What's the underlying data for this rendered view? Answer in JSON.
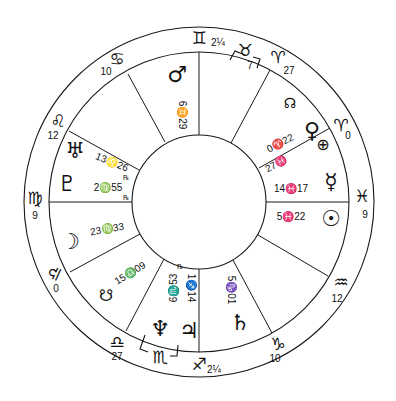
{
  "chart_title": "",
  "colors": {
    "ink": "#111111",
    "background": "#ffffff"
  },
  "wheel": {
    "center": [
      199,
      202
    ],
    "outer_radius": 175,
    "sign_ring_inner_radius": 150,
    "inner_circle_radius": 67
  },
  "signs_on_cusps": [
    {
      "id": "gemini",
      "glyph": "♊",
      "degree": "2¼",
      "label": "♊ 2¼"
    },
    {
      "id": "taurus",
      "glyph": "♉",
      "degree": "7",
      "label": "♉ 7 (intercepted)"
    },
    {
      "id": "aries-top",
      "glyph": "♈",
      "degree": "27",
      "label": "♈ 27"
    },
    {
      "id": "aries-right",
      "glyph": "♈",
      "degree": "0",
      "label": "♈ 0"
    },
    {
      "id": "pisces",
      "glyph": "♓",
      "degree": "9",
      "label": "♓ 9"
    },
    {
      "id": "aquarius",
      "glyph": "♒",
      "degree": "12",
      "label": "♒ 12"
    },
    {
      "id": "capricorn",
      "glyph": "♑",
      "degree": "10",
      "label": "♑ 10"
    },
    {
      "id": "sagittarius",
      "glyph": "♐",
      "degree": "2¼",
      "label": "♐ 2¼"
    },
    {
      "id": "scorpio",
      "glyph": "♏",
      "degree": "",
      "label": "♏ (intercepted)"
    },
    {
      "id": "libra-bottom",
      "glyph": "♎",
      "degree": "27",
      "label": "♎ 27"
    },
    {
      "id": "libra-left",
      "glyph": "♎",
      "degree": "0",
      "label": "♎ 0"
    },
    {
      "id": "virgo",
      "glyph": "♍",
      "degree": "9",
      "label": "♍ 9"
    },
    {
      "id": "leo",
      "glyph": "♌",
      "degree": "12",
      "label": "♌ 12"
    },
    {
      "id": "cancer",
      "glyph": "♋",
      "degree": "10",
      "label": "♋ 10"
    }
  ],
  "planets": [
    {
      "id": "mars",
      "glyph": "♂",
      "position": "6♊29"
    },
    {
      "id": "north-node",
      "glyph": "☊",
      "position": ""
    },
    {
      "id": "venus",
      "glyph": "♀",
      "position": "0♈22"
    },
    {
      "id": "part-of-fortune",
      "glyph": "⊕",
      "position": "27♓"
    },
    {
      "id": "mercury",
      "glyph": "☿",
      "position": "14♓17"
    },
    {
      "id": "sun",
      "glyph": "☉",
      "position": "5♓22"
    },
    {
      "id": "saturn",
      "glyph": "♄",
      "position": "5♑01"
    },
    {
      "id": "jupiter",
      "glyph": "♃",
      "position": "1♐14"
    },
    {
      "id": "neptune",
      "glyph": "♆",
      "position": "6♏53"
    },
    {
      "id": "south-node",
      "glyph": "☋",
      "position": "15♎09"
    },
    {
      "id": "moon",
      "glyph": "☽",
      "position": "23♍33"
    },
    {
      "id": "pluto",
      "glyph": "♇",
      "position": "2♍55"
    },
    {
      "id": "uranus",
      "glyph": "♅",
      "position": "13♌26"
    }
  ],
  "text": {
    "gemini_sign": "♊",
    "gemini_deg": "2¼",
    "taurus_sign": "♉",
    "taurus_deg": "7",
    "aries_top_sign": "♈",
    "aries_top_deg": "27",
    "aries_right_sign": "♈",
    "aries_right_deg": "0",
    "pisces_sign": "♓",
    "pisces_deg": "9",
    "aquarius_sign": "♒",
    "aquarius_deg": "12",
    "capricorn_sign": "♑",
    "capricorn_deg": "10",
    "sagittarius_sign": "♐",
    "sagittarius_deg": "2¼",
    "scorpio_sign": "♏",
    "libra_bottom_sign": "♎",
    "libra_bottom_deg": "27",
    "libra_left_sign": "♎",
    "libra_left_deg": "0",
    "virgo_sign": "♍",
    "virgo_deg": "9",
    "leo_sign": "♌",
    "leo_deg": "12",
    "cancer_sign": "♋",
    "cancer_deg": "10",
    "mars_glyph": "♂",
    "mars_pos": "6♊29",
    "nnode_glyph": "☊",
    "venus_glyph": "♀",
    "venus_pos": "0♈22",
    "pof_glyph": "⊕",
    "pof_pos": "27♓",
    "mercury_glyph": "☿",
    "mercury_pos": "14♓17",
    "sun_glyph": "☉",
    "sun_pos": "5♓22",
    "saturn_glyph": "♄",
    "saturn_pos": "5♑01",
    "jupiter_glyph": "♃",
    "jupiter_pos": "1♐14",
    "neptune_glyph": "♆",
    "neptune_pos": "6♏53",
    "snode_glyph": "☋",
    "snode_pos": "15♎09",
    "moon_glyph": "☽",
    "moon_pos": "23♍33",
    "pluto_glyph": "♇",
    "pluto_pos": "2♍55",
    "uranus_glyph": "♅",
    "uranus_pos": "13♌26",
    "rx_mark": "℞"
  }
}
